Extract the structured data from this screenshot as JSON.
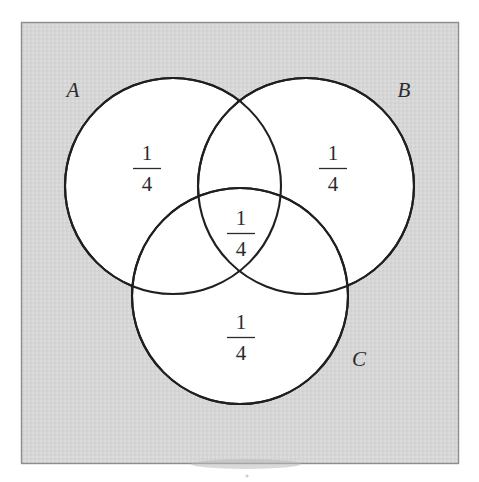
{
  "figure": {
    "type": "venn-diagram",
    "sets_count": 3,
    "background_color": "#ffffff",
    "plate": {
      "fill_color": "#d6d6d6",
      "border_color": "#8d8d8d",
      "x": 21,
      "y": 22,
      "width": 438,
      "height": 442
    },
    "circle_style": {
      "fill_color": "#ffffff",
      "stroke_color": "#1f1f1f",
      "radius": 108
    },
    "text_color": "#2b2b2b"
  },
  "sets": [
    {
      "id": "A",
      "label": "A",
      "label_x": 73,
      "label_y": 97,
      "cx": 173,
      "cy": 186
    },
    {
      "id": "B",
      "label": "B",
      "label_x": 404,
      "label_y": 97,
      "cx": 306,
      "cy": 186
    },
    {
      "id": "C",
      "label": "C",
      "label_x": 359,
      "label_y": 366,
      "cx": 240,
      "cy": 296
    }
  ],
  "regions": [
    {
      "id": "region-a-only",
      "set": "A",
      "numerator": "1",
      "denominator": "4",
      "value_text": "1/4",
      "x": 147,
      "y": 165
    },
    {
      "id": "region-b-only",
      "set": "B",
      "numerator": "1",
      "denominator": "4",
      "value_text": "1/4",
      "x": 333,
      "y": 165
    },
    {
      "id": "region-abc-intersection",
      "set": "A∩B∩C",
      "numerator": "1",
      "denominator": "4",
      "value_text": "1/4",
      "x": 241,
      "y": 230
    },
    {
      "id": "region-c-only",
      "set": "C",
      "numerator": "1",
      "denominator": "4",
      "value_text": "1/4",
      "x": 241,
      "y": 334
    }
  ]
}
